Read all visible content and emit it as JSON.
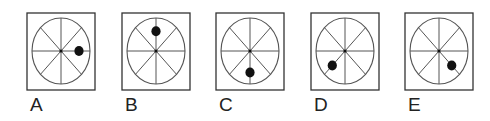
{
  "colors": {
    "stroke": "#555555",
    "box": "#333333",
    "dot": "#111111"
  },
  "options": [
    {
      "label": "A",
      "box_x": 27,
      "dot_angle_deg": 0,
      "dot_dist": 0.62
    },
    {
      "label": "B",
      "box_x": 122,
      "dot_angle_deg": 270,
      "dot_dist": 0.6
    },
    {
      "label": "C",
      "box_x": 216,
      "dot_angle_deg": 90,
      "dot_dist": 0.65
    },
    {
      "label": "D",
      "box_x": 311,
      "dot_angle_deg": 135,
      "dot_dist": 0.62
    },
    {
      "label": "E",
      "box_x": 405,
      "dot_angle_deg": 45,
      "dot_dist": 0.62
    }
  ]
}
